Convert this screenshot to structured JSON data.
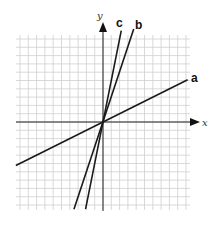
{
  "chart_data": {
    "type": "line",
    "title": "",
    "xlabel": "x",
    "ylabel": "y",
    "grid": true,
    "xlim": [
      -10.5,
      10.5
    ],
    "ylim": [
      -10.5,
      10.5
    ],
    "series": [
      {
        "name": "a",
        "slope": 0.5,
        "x": [
          -10.5,
          10.2
        ],
        "y": [
          -5.25,
          5.1
        ]
      },
      {
        "name": "b",
        "slope": 3,
        "x": [
          -3.5,
          3.7
        ],
        "y": [
          -10.5,
          11.2
        ]
      },
      {
        "name": "c",
        "slope": 5,
        "x": [
          -2.1,
          2.2
        ],
        "y": [
          -10.5,
          11.0
        ]
      }
    ]
  },
  "labels": {
    "x_axis": "x",
    "y_axis": "y",
    "line_a": "a",
    "line_b": "b",
    "line_c": "c"
  },
  "colors": {
    "grid": "#cfcfcf",
    "axis": "#222222",
    "line": "#1a1a1a"
  }
}
